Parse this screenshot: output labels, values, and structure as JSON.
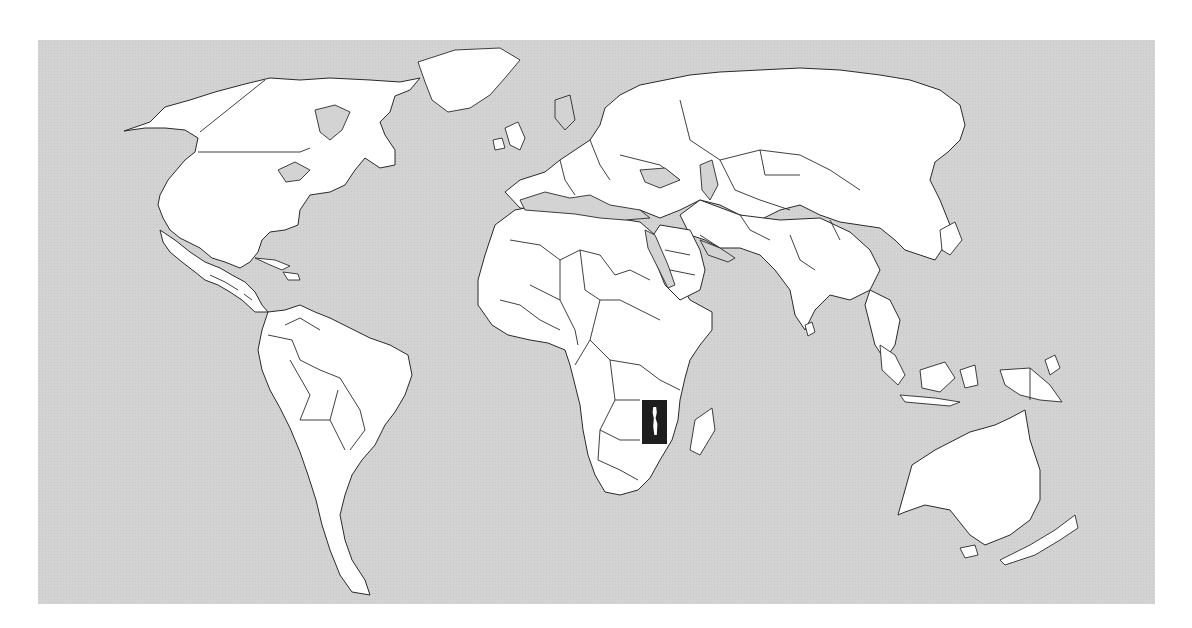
{
  "map": {
    "type": "world-locator-map",
    "projection": "equirectangular",
    "highlighted_country": "Malawi",
    "highlight_style": "black-rectangle",
    "colors": {
      "ocean": "#d3d3d3",
      "land": "#ffffff",
      "border": "#2a2a2a",
      "highlight": "#1e1e1e",
      "page_background": "#ffffff"
    },
    "frame": {
      "x": 38,
      "y": 40,
      "width": 1117,
      "height": 564
    },
    "highlight_box": {
      "x": 642,
      "y": 400,
      "width": 25,
      "height": 44
    }
  }
}
